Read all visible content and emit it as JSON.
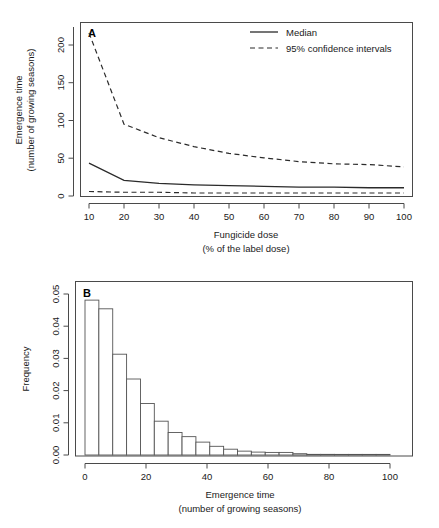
{
  "figure": {
    "background": "#ffffff",
    "line_color": "#2b2b2b",
    "axis_color": "#4a4a4a"
  },
  "panel_a": {
    "letter": "A",
    "legend": {
      "median_label": "Median",
      "ci_label": "95% confidence intervals"
    }
  },
  "panel_b": {
    "letter": "B"
  },
  "chart_data": [
    {
      "type": "line",
      "panel": "A",
      "title": "",
      "xlabel": "Fungicide dose",
      "xlabel_line2": "(% of the label dose)",
      "ylabel": "Emergence time",
      "ylabel_line2": "(number of growing seasons)",
      "xlim": [
        7,
        103
      ],
      "ylim": [
        0,
        232
      ],
      "xticks": [
        10,
        20,
        30,
        40,
        50,
        60,
        70,
        80,
        90,
        100
      ],
      "xticklabels": [
        "10",
        "20",
        "30",
        "40",
        "50",
        "60",
        "70",
        "80",
        "90",
        "100"
      ],
      "yticks": [
        0,
        50,
        100,
        150,
        200
      ],
      "yticklabels": [
        "0",
        "50",
        "100",
        "150",
        "200"
      ],
      "grid": false,
      "legend_position": "top-right",
      "x": [
        10,
        20,
        30,
        40,
        50,
        60,
        70,
        80,
        90,
        100
      ],
      "series": [
        {
          "name": "95% confidence intervals",
          "style": "dashed",
          "bound": "upper",
          "values": [
            218,
            96,
            78,
            66,
            57,
            51,
            46,
            43,
            42,
            39
          ]
        },
        {
          "name": "Median",
          "style": "solid",
          "values": [
            44,
            21,
            17,
            15,
            14,
            13,
            12,
            12,
            11,
            11
          ]
        },
        {
          "name": "95% confidence intervals",
          "style": "dashed",
          "bound": "lower",
          "values": [
            6,
            5,
            5,
            4,
            4,
            4,
            4,
            4,
            4,
            4
          ]
        }
      ]
    },
    {
      "type": "bar",
      "panel": "B",
      "title": "",
      "xlabel": "Emergence time",
      "xlabel_line2": "(number of growing seasons)",
      "ylabel": "Frequency",
      "xlim": [
        0,
        110
      ],
      "ylim": [
        0,
        0.0535
      ],
      "xticks": [
        0,
        20,
        40,
        60,
        80,
        100
      ],
      "xticklabels": [
        "0",
        "20",
        "40",
        "60",
        "80",
        "100"
      ],
      "yticks": [
        0,
        0.01,
        0.02,
        0.03,
        0.04,
        0.05
      ],
      "yticklabels": [
        "0.00",
        "0.01",
        "0.02",
        "0.03",
        "0.04",
        "0.05"
      ],
      "grid": false,
      "bin_width": 5,
      "bin_starts": [
        0,
        5,
        10,
        15,
        20,
        25,
        30,
        35,
        40,
        45,
        50,
        55,
        60,
        65,
        70,
        75,
        80,
        85,
        90,
        95,
        100,
        105
      ],
      "categories": [
        "0-5",
        "5-10",
        "10-15",
        "15-20",
        "20-25",
        "25-30",
        "30-35",
        "35-40",
        "40-45",
        "45-50",
        "50-55",
        "55-60",
        "60-65",
        "65-70",
        "70-75",
        "75-80",
        "80-85",
        "85-90",
        "90-95",
        "95-100",
        "100-105",
        "105-110"
      ],
      "values": [
        0.0481,
        0.0454,
        0.0313,
        0.0236,
        0.016,
        0.0105,
        0.007,
        0.0057,
        0.004,
        0.0027,
        0.0018,
        0.0012,
        0.0009,
        0.0008,
        0.0008,
        0.0004,
        0.0002,
        0.0002,
        0.0001,
        0.0001,
        0.0001,
        0.0001
      ]
    }
  ]
}
